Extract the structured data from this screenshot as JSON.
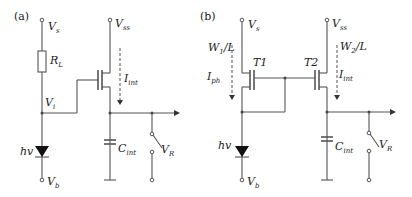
{
  "figure": {
    "panels": [
      {
        "id": "a",
        "label": "(a)",
        "labels": {
          "vs": "V",
          "vs_sub": "s",
          "vss": "V",
          "vss_sub": "ss",
          "rl": "R",
          "rl_sub": "L",
          "iint": "I",
          "iint_sub": "int",
          "vi": "V",
          "vi_sub": "i",
          "hv": "hv",
          "vb": "V",
          "vb_sub": "b",
          "cint": "C",
          "cint_sub": "int",
          "vr": "V",
          "vr_sub": "R"
        }
      },
      {
        "id": "b",
        "label": "(b)",
        "labels": {
          "vs": "V",
          "vs_sub": "s",
          "vss": "V",
          "vss_sub": "ss",
          "w1l": "W",
          "w1l_sub": "1",
          "w1l_rest": "/L",
          "w2l": "W",
          "w2l_sub": "2",
          "w2l_rest": "/L",
          "t1": "T1",
          "t2": "T2",
          "iph": "I",
          "iph_sub": "ph",
          "iint": "I",
          "iint_sub": "int",
          "hv": "hv",
          "vb": "V",
          "vb_sub": "b",
          "cint": "C",
          "cint_sub": "int",
          "vr": "V",
          "vr_sub": "R"
        }
      }
    ],
    "colors": {
      "wire": "#555555",
      "text": "#222222",
      "background": "#ffffff"
    }
  }
}
